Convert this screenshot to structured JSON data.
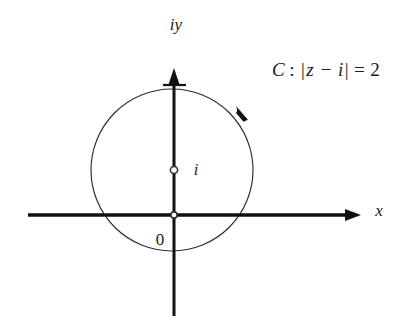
{
  "figure": {
    "type": "complex-plane-contour-diagram",
    "background_color": "#ffffff",
    "ink_color": "#111111",
    "width": 402,
    "height": 335,
    "axes": {
      "horizontal": {
        "label": "x",
        "meaning": "real axis",
        "arrow_direction": "right",
        "label_position": {
          "x": 379,
          "y": 212
        },
        "start_x": 28,
        "end_x": 358,
        "y": 215
      },
      "vertical": {
        "label": "iy",
        "meaning": "imaginary axis",
        "arrow_direction": "up",
        "label_position": {
          "x": 176,
          "y": 26
        },
        "x": 174,
        "top_y": 70,
        "bottom_y": 316
      }
    },
    "origin": {
      "label": "0",
      "marker": "open-circle",
      "x": 174,
      "y": 215,
      "label_position": {
        "x": 160,
        "y": 240
      }
    },
    "center_point": {
      "label": "i",
      "marker": "open-circle",
      "x": 174,
      "y": 170,
      "label_position": {
        "x": 196,
        "y": 171
      },
      "meaning": "center of circle C at z = i"
    },
    "circle": {
      "center_x": 172,
      "center_y": 170,
      "radius": 81,
      "stroke": "#2b2b2b",
      "direction": "clockwise",
      "direction_arrow_position": {
        "x": 242,
        "y": 113
      }
    },
    "annotation": {
      "name_symbol": "C",
      "colon": ":",
      "modulus_open": "|",
      "expression": "z − i",
      "modulus_close": "|",
      "equals": "=",
      "value": "2",
      "full_text": "C : |z − i| = 2",
      "position": {
        "x": 272,
        "y": 72
      }
    }
  }
}
